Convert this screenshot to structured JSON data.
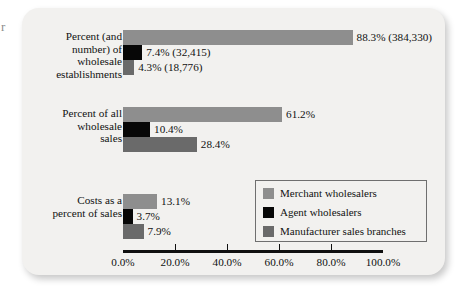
{
  "stray_glyph": "r",
  "chart_data": {
    "type": "bar",
    "orientation": "horizontal",
    "title": "",
    "xlabel": "",
    "ylabel": "",
    "xlim": [
      0,
      100
    ],
    "grid": false,
    "legend_position": "inside-bottom-right",
    "categories": [
      "Percent (and\nnumber) of\nwholesale\nestablishments",
      "Percent of all\nwholesale\nsales",
      "Costs as a\npercent of sales"
    ],
    "axis_ticks": [
      "0.0%",
      "20.0%",
      "40.0%",
      "60.0%",
      "80.0%",
      "100.0%"
    ],
    "axis_tick_values": [
      0,
      20,
      40,
      60,
      80,
      100
    ],
    "series": [
      {
        "name": "Merchant wholesalers",
        "color": "#8e8e8e",
        "values": [
          88.3,
          61.2,
          13.1
        ],
        "labels": [
          "88.3% (384,330)",
          "61.2%",
          "13.1%"
        ]
      },
      {
        "name": "Agent wholesalers",
        "color": "#070707",
        "values": [
          7.4,
          10.4,
          3.7
        ],
        "labels": [
          "7.4% (32,415)",
          "10.4%",
          "3.7%"
        ]
      },
      {
        "name": "Manufacturer sales branches",
        "color": "#6a6a6a",
        "values": [
          4.3,
          28.4,
          7.9
        ],
        "labels": [
          "4.3% (18,776)",
          "28.4%",
          "7.9%"
        ]
      }
    ]
  }
}
